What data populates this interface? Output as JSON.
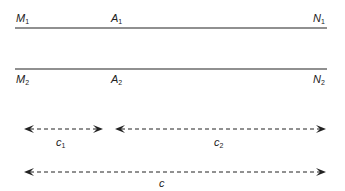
{
  "diagram": {
    "lines": [
      {
        "id": "line-1",
        "y": 28,
        "x1": 15,
        "x2": 327,
        "color": "#6b6b6b",
        "labels": [
          {
            "name": "M",
            "sub": "1",
            "x": 16,
            "y": 12
          },
          {
            "name": "A",
            "sub": "1",
            "x": 111,
            "y": 12
          },
          {
            "name": "N",
            "sub": "1",
            "x": 313,
            "y": 12
          }
        ]
      },
      {
        "id": "line-2",
        "y": 69,
        "x1": 15,
        "x2": 327,
        "color": "#6b6b6b",
        "labels": [
          {
            "name": "M",
            "sub": "2",
            "x": 16,
            "y": 73
          },
          {
            "name": "A",
            "sub": "2",
            "x": 111,
            "y": 73
          },
          {
            "name": "N",
            "sub": "2",
            "x": 313,
            "y": 73
          }
        ]
      }
    ],
    "arrows": [
      {
        "id": "c1",
        "label": "c",
        "sub": "1",
        "y": 129,
        "x1": 24,
        "x2": 103,
        "label_x": 56,
        "label_y": 136
      },
      {
        "id": "c2",
        "label": "c",
        "sub": "2",
        "y": 129,
        "x1": 115,
        "x2": 326,
        "label_x": 214,
        "label_y": 136
      },
      {
        "id": "c",
        "label": "c",
        "sub": "",
        "y": 172,
        "x1": 24,
        "x2": 326,
        "label_x": 159,
        "label_y": 177
      }
    ],
    "arrow_color": "#222222"
  }
}
